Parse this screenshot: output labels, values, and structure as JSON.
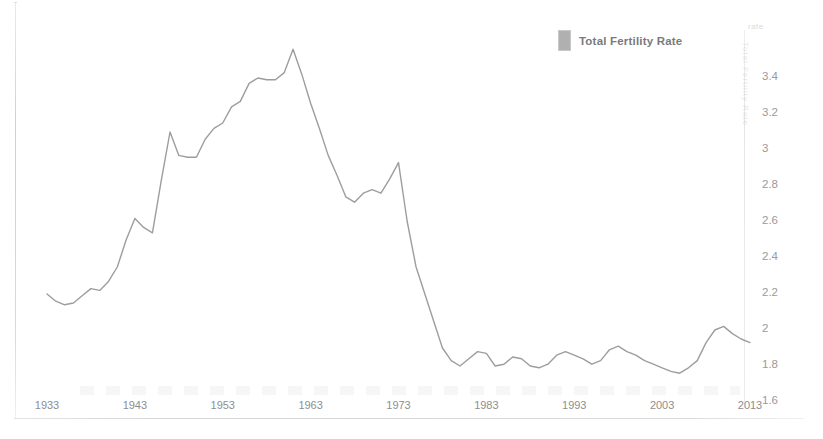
{
  "legend": {
    "entries": [
      {
        "label": "Total Fertility Rate",
        "color": "#b0b0b0"
      }
    ],
    "position": "top-right"
  },
  "watermark": {
    "side_text": "Total Fertility Rate",
    "corner_text": "rate"
  },
  "axes": {
    "y_ticks": [
      "3.4",
      "3.2",
      "3",
      "2.8",
      "2.6",
      "2.4",
      "2.2",
      "2",
      "1.8",
      "1.6"
    ],
    "x_ticks": [
      "1933",
      "1943",
      "1953",
      "1963",
      "1973",
      "1983",
      "1993",
      "2003",
      "2013"
    ],
    "y_axis_side": "right",
    "grid": "off"
  },
  "chart_data": {
    "type": "line",
    "title": "",
    "subtitle": "",
    "xlabel": "",
    "ylabel": "",
    "xlim": [
      1933,
      2013
    ],
    "ylim": [
      1.6,
      3.6
    ],
    "grid": false,
    "legend_position": "top-right",
    "line_color": "#8c8c8c",
    "series": [
      {
        "name": "Total Fertility Rate",
        "x": [
          1933,
          1934,
          1935,
          1936,
          1937,
          1938,
          1939,
          1940,
          1941,
          1942,
          1943,
          1944,
          1945,
          1946,
          1947,
          1948,
          1949,
          1950,
          1951,
          1952,
          1953,
          1954,
          1955,
          1956,
          1957,
          1958,
          1959,
          1960,
          1961,
          1962,
          1963,
          1964,
          1965,
          1966,
          1967,
          1968,
          1969,
          1970,
          1971,
          1972,
          1973,
          1974,
          1975,
          1976,
          1977,
          1978,
          1979,
          1980,
          1981,
          1982,
          1983,
          1984,
          1985,
          1986,
          1987,
          1988,
          1989,
          1990,
          1991,
          1992,
          1993,
          1994,
          1995,
          1996,
          1997,
          1998,
          1999,
          2000,
          2001,
          2002,
          2003,
          2004,
          2005,
          2006,
          2007,
          2008,
          2009,
          2010,
          2011,
          2012,
          2013
        ],
        "values": [
          2.2,
          2.16,
          2.14,
          2.15,
          2.19,
          2.23,
          2.22,
          2.27,
          2.35,
          2.5,
          2.62,
          2.57,
          2.54,
          2.83,
          3.1,
          2.97,
          2.96,
          2.96,
          3.06,
          3.12,
          3.15,
          3.24,
          3.27,
          3.37,
          3.4,
          3.39,
          3.39,
          3.43,
          3.56,
          3.42,
          3.26,
          3.12,
          2.97,
          2.86,
          2.74,
          2.71,
          2.76,
          2.78,
          2.76,
          2.84,
          2.93,
          2.6,
          2.35,
          2.2,
          2.05,
          1.9,
          1.83,
          1.8,
          1.84,
          1.88,
          1.87,
          1.8,
          1.81,
          1.85,
          1.84,
          1.8,
          1.79,
          1.81,
          1.86,
          1.88,
          1.86,
          1.84,
          1.81,
          1.83,
          1.89,
          1.91,
          1.88,
          1.86,
          1.83,
          1.81,
          1.79,
          1.77,
          1.76,
          1.79,
          1.83,
          1.93,
          2.0,
          2.02,
          1.98,
          1.95,
          1.93
        ],
        "annotations": [
          {
            "label": "start",
            "x": 1933,
            "y": 2.2
          },
          {
            "label": "depression low",
            "x": 1936,
            "y": 2.14
          },
          {
            "label": "post-war spike",
            "x": 1947,
            "y": 3.1
          },
          {
            "label": "baby boom peak",
            "x": 1961,
            "y": 3.56
          },
          {
            "label": "pre-bust plateau",
            "x": 1973,
            "y": 2.93
          },
          {
            "label": "baby bust low",
            "x": 1980,
            "y": 1.8
          },
          {
            "label": "2000s trough",
            "x": 2005,
            "y": 1.76
          },
          {
            "label": "recent peak",
            "x": 2010,
            "y": 2.02
          },
          {
            "label": "end",
            "x": 2013,
            "y": 1.93
          }
        ]
      }
    ]
  }
}
